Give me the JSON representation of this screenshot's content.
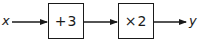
{
  "diagram": {
    "input_label": "x",
    "output_label": "y",
    "steps": [
      {
        "operation": "+3"
      },
      {
        "operation": "×2"
      }
    ],
    "colors": {
      "stroke": "#1a1a1a",
      "background": "#ffffff"
    }
  }
}
